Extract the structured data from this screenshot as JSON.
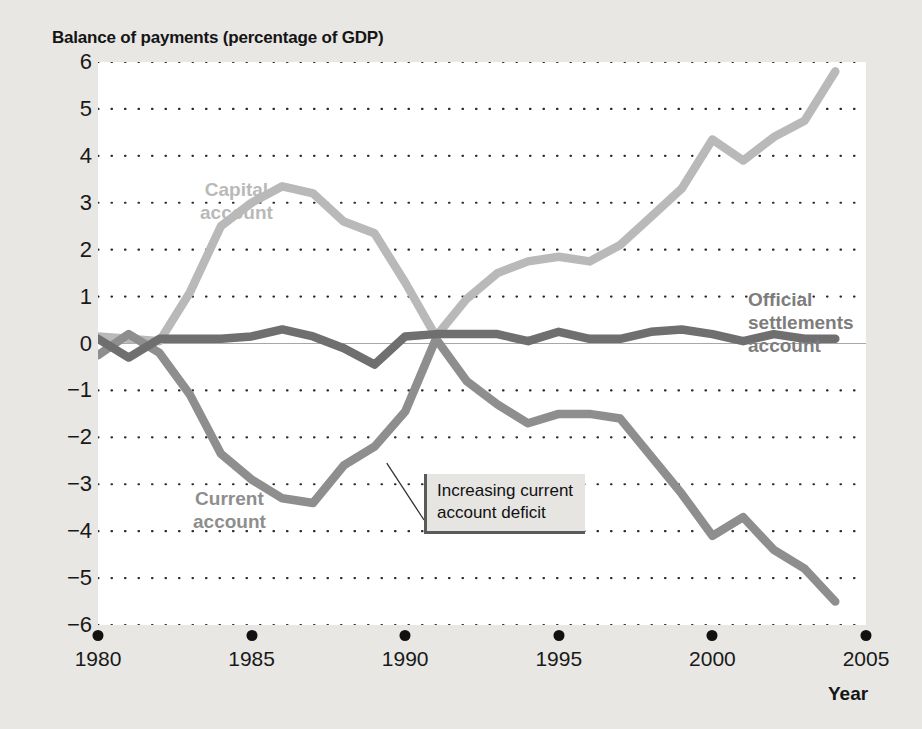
{
  "chart_data": {
    "type": "line",
    "title": "Balance of payments (percentage of GDP)",
    "xlabel": "Year",
    "ylabel": "",
    "xlim": [
      1980,
      2005
    ],
    "ylim": [
      -6,
      6
    ],
    "grid": true,
    "legend_position": "inline-labels",
    "x_ticks": [
      "1980",
      "1985",
      "1990",
      "1995",
      "2000",
      "2005"
    ],
    "y_ticks": [
      "6",
      "5",
      "4",
      "3",
      "2",
      "1",
      "0",
      "−1",
      "−2",
      "−3",
      "−4",
      "−5",
      "−6"
    ],
    "x": [
      1980,
      1981,
      1982,
      1983,
      1984,
      1985,
      1986,
      1987,
      1988,
      1989,
      1990,
      1991,
      1992,
      1993,
      1994,
      1995,
      1996,
      1997,
      1998,
      1999,
      2000,
      2001,
      2002,
      2003,
      2004
    ],
    "series": [
      {
        "name": "Capital account",
        "color": "#b9b9b9",
        "values": [
          0.15,
          0.1,
          0.05,
          1.1,
          2.5,
          3.0,
          3.35,
          3.2,
          2.6,
          2.35,
          1.3,
          0.15,
          0.95,
          1.5,
          1.75,
          1.85,
          1.75,
          2.1,
          2.7,
          3.3,
          4.35,
          3.9,
          4.4,
          4.75,
          5.8
        ]
      },
      {
        "name": "Current account",
        "color": "#8e8e8e",
        "values": [
          -0.25,
          0.2,
          -0.2,
          -1.1,
          -2.35,
          -2.9,
          -3.3,
          -3.4,
          -2.6,
          -2.2,
          -1.45,
          0.1,
          -0.8,
          -1.3,
          -1.7,
          -1.5,
          -1.5,
          -1.6,
          -2.4,
          -3.2,
          -4.1,
          -3.7,
          -4.4,
          -4.8,
          -5.5
        ]
      },
      {
        "name": "Official settlements account",
        "color": "#6f6f6f",
        "values": [
          0.1,
          -0.3,
          0.1,
          0.1,
          0.1,
          0.15,
          0.3,
          0.15,
          -0.1,
          -0.45,
          0.15,
          0.2,
          0.2,
          0.2,
          0.05,
          0.25,
          0.1,
          0.1,
          0.25,
          0.3,
          0.2,
          0.05,
          0.2,
          0.1,
          0.1
        ]
      }
    ],
    "annotations": [
      {
        "text_line1": "Increasing current",
        "text_line2": "account deficit",
        "points_to_x": 1989.4,
        "points_to_y": -2.55
      }
    ],
    "series_labels": {
      "capital_line1": "Capital",
      "capital_line2": "account",
      "current_line1": "Current",
      "current_line2": "account",
      "official_line1": "Official",
      "official_line2": "settlements",
      "official_line3": "account"
    }
  }
}
